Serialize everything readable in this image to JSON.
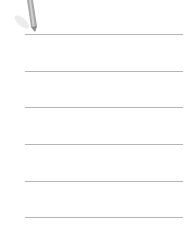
{
  "icon": {
    "name": "pencil-icon"
  },
  "lines": [
    {
      "y": 34
    },
    {
      "y": 71
    },
    {
      "y": 107
    },
    {
      "y": 144
    },
    {
      "y": 181
    },
    {
      "y": 217
    }
  ],
  "colors": {
    "line": "#b4b4b4",
    "pencil_body": "#a8a8a8",
    "pencil_shadow": "#e6e6e6"
  }
}
